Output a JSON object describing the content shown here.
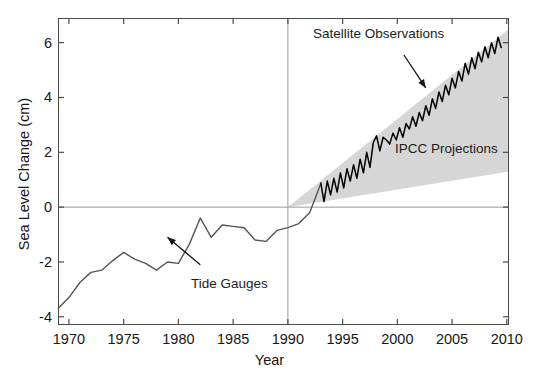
{
  "chart_data": {
    "type": "line",
    "title": "",
    "xlabel": "Year",
    "ylabel": "Sea Level Change (cm)",
    "xlim": [
      1969,
      2010.2
    ],
    "ylim": [
      -4.3,
      6.9
    ],
    "xticks": [
      1970,
      1975,
      1980,
      1985,
      1990,
      1995,
      2000,
      2005,
      2010
    ],
    "xtick_labels": [
      "1970",
      "1975",
      "1980",
      "1985",
      "1990",
      "1995",
      "2000",
      "2005",
      "2010"
    ],
    "yticks": [
      -4,
      -2,
      0,
      2,
      4,
      6
    ],
    "ytick_labels": [
      "-4",
      "-2",
      "0",
      "2",
      "4",
      "6"
    ],
    "grid": false,
    "legend_position": "none",
    "zero_line": 0,
    "reference_line_x": 1990,
    "annotations": [
      {
        "id": "satellite",
        "text": "Satellite Observations",
        "x": 1996.2,
        "y": 6.25,
        "arrow_from": [
          2000.6,
          5.55
        ],
        "arrow_to": [
          2002.6,
          4.35
        ]
      },
      {
        "id": "ipcc",
        "text": "IPCC Projections",
        "x": 2003.1,
        "y": 2.2
      },
      {
        "id": "tide",
        "text": "Tide Gauges",
        "x": 1981.5,
        "y": -2.4,
        "arrow_from": [
          1982.0,
          -2.1
        ],
        "arrow_to": [
          1979.0,
          -1.1
        ]
      }
    ],
    "series": [
      {
        "name": "Tide Gauges",
        "style": "line",
        "color": "#555555",
        "x": [
          1969.0,
          1970.0,
          1971.0,
          1972.0,
          1973.0,
          1974.0,
          1975.0,
          1976.0,
          1977.0,
          1978.0,
          1979.0,
          1980.0,
          1981.0,
          1982.0,
          1983.0,
          1984.0,
          1985.0,
          1986.0,
          1987.0,
          1988.0,
          1989.0,
          1990.0,
          1991.0,
          1992.0,
          1993.0
        ],
        "y": [
          -3.7,
          -3.3,
          -2.75,
          -2.38,
          -2.3,
          -1.95,
          -1.65,
          -1.9,
          -2.05,
          -2.3,
          -2.0,
          -2.05,
          -1.35,
          -0.4,
          -1.1,
          -0.65,
          -0.7,
          -0.75,
          -1.2,
          -1.25,
          -0.85,
          -0.75,
          -0.6,
          -0.2,
          0.85
        ]
      },
      {
        "name": "Satellite Observations",
        "style": "line-noisy",
        "color": "#000000",
        "x": [
          1993.0,
          1993.3,
          1993.6,
          1993.9,
          1994.2,
          1994.5,
          1994.8,
          1995.1,
          1995.4,
          1995.7,
          1996.0,
          1996.3,
          1996.6,
          1996.9,
          1997.2,
          1997.5,
          1997.8,
          1998.1,
          1998.4,
          1998.7,
          1999.0,
          1999.3,
          1999.6,
          1999.9,
          2000.2,
          2000.5,
          2000.8,
          2001.1,
          2001.4,
          2001.7,
          2002.0,
          2002.3,
          2002.6,
          2002.9,
          2003.2,
          2003.5,
          2003.8,
          2004.1,
          2004.4,
          2004.7,
          2005.0,
          2005.3,
          2005.6,
          2005.9,
          2006.2,
          2006.5,
          2006.8,
          2007.1,
          2007.4,
          2007.7,
          2008.0,
          2008.3,
          2008.6,
          2008.9,
          2009.2,
          2009.5
        ],
        "y": [
          0.9,
          0.2,
          0.95,
          0.45,
          1.05,
          0.55,
          1.25,
          0.7,
          1.4,
          0.95,
          1.55,
          1.05,
          1.75,
          1.25,
          2.0,
          1.45,
          2.35,
          2.6,
          2.05,
          2.55,
          2.45,
          2.3,
          2.7,
          2.45,
          2.9,
          2.55,
          3.05,
          2.85,
          3.3,
          2.95,
          3.45,
          3.15,
          3.7,
          3.35,
          3.95,
          3.6,
          4.2,
          3.85,
          4.45,
          4.1,
          4.7,
          4.35,
          4.95,
          4.6,
          5.25,
          4.85,
          5.45,
          5.05,
          5.65,
          5.3,
          5.85,
          5.45,
          6.0,
          5.6,
          6.2,
          5.8
        ]
      }
    ],
    "bands": [
      {
        "name": "IPCC Projections",
        "fill": "#d6d6d6",
        "x": [
          1990.0,
          2010.2
        ],
        "y_low": [
          0.0,
          1.3
        ],
        "y_high": [
          0.0,
          6.5
        ]
      }
    ]
  }
}
